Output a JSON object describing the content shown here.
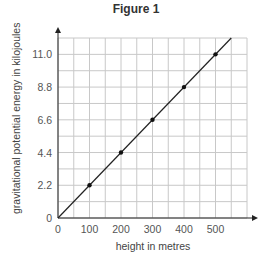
{
  "chart_data": {
    "type": "line",
    "title": "Figure 1",
    "xlabel": "height in metres",
    "ylabel": "gravitational potential energy in kilojoules",
    "x_ticks": [
      0,
      100,
      200,
      300,
      400,
      500
    ],
    "y_ticks": [
      0,
      2.2,
      4.4,
      6.6,
      8.8,
      11.0
    ],
    "y_tick_labels": [
      "0",
      "2.2",
      "4.4",
      "6.6",
      "8.8",
      "11.0"
    ],
    "xlim": [
      0,
      600
    ],
    "ylim": [
      0,
      12.1
    ],
    "grid": true,
    "series": [
      {
        "name": "data",
        "x": [
          100,
          200,
          300,
          400,
          500
        ],
        "y": [
          2.2,
          4.4,
          6.6,
          8.8,
          11.0
        ],
        "markers": true
      }
    ],
    "best_fit_line": {
      "x": [
        0,
        550
      ],
      "y": [
        0,
        12.1
      ]
    }
  }
}
